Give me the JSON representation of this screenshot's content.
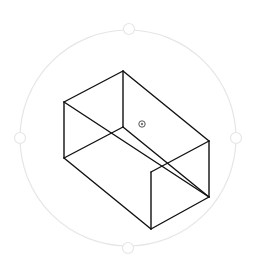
{
  "viewport": {
    "background": "#ffffff",
    "orbit": {
      "cx": 128,
      "cy": 138,
      "r": 108,
      "color": "#e6e6e6",
      "handles": [
        {
          "name": "top",
          "x": 129,
          "y": 29
        },
        {
          "name": "bottom",
          "x": 128,
          "y": 248
        },
        {
          "name": "left",
          "x": 20,
          "y": 138
        },
        {
          "name": "right",
          "x": 236,
          "y": 138
        }
      ]
    },
    "box": {
      "stroke": "#111111",
      "edges": [
        [
          [
            123,
            71
          ],
          [
            64,
            102
          ]
        ],
        [
          [
            123,
            71
          ],
          [
            209,
            141
          ]
        ],
        [
          [
            123,
            71
          ],
          [
            123,
            127
          ]
        ],
        [
          [
            64,
            102
          ],
          [
            64,
            158
          ]
        ],
        [
          [
            64,
            102
          ],
          [
            209,
            197
          ]
        ],
        [
          [
            64,
            158
          ],
          [
            151,
            229
          ]
        ],
        [
          [
            64,
            158
          ],
          [
            123,
            127
          ]
        ],
        [
          [
            123,
            127
          ],
          [
            209,
            197
          ]
        ],
        [
          [
            209,
            141
          ],
          [
            209,
            197
          ]
        ],
        [
          [
            209,
            141
          ],
          [
            151,
            172
          ]
        ],
        [
          [
            151,
            172
          ],
          [
            151,
            229
          ]
        ],
        [
          [
            151,
            229
          ],
          [
            209,
            197
          ]
        ]
      ]
    },
    "pivot": {
      "x": 142,
      "y": 124,
      "icon": "pivot-target-icon"
    }
  }
}
